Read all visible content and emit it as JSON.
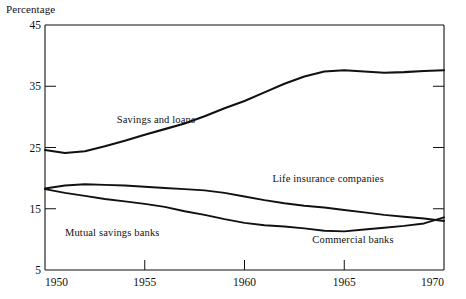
{
  "chart_data": {
    "type": "line",
    "title": "",
    "ylabel": "Percentage",
    "xlabel": "",
    "xlim": [
      1950,
      1970
    ],
    "ylim": [
      5,
      45
    ],
    "grid": false,
    "legend_position": "inline-annotations",
    "yticks": [
      5,
      15,
      25,
      35,
      45
    ],
    "xticks": [
      1950,
      1955,
      1960,
      1965,
      1970
    ],
    "series": [
      {
        "name": "Savings and loans",
        "x": [
          1950,
          1951,
          1952,
          1953,
          1954,
          1955,
          1956,
          1957,
          1958,
          1959,
          1960,
          1961,
          1962,
          1963,
          1964,
          1965,
          1966,
          1967,
          1968,
          1969,
          1970
        ],
        "values": [
          24.6,
          24.1,
          24.4,
          25.2,
          26.1,
          27.1,
          28.0,
          28.9,
          30.1,
          31.4,
          32.6,
          34.0,
          35.4,
          36.6,
          37.4,
          37.6,
          37.4,
          37.2,
          37.3,
          37.5,
          37.6
        ]
      },
      {
        "name": "Life insurance companies",
        "x": [
          1950,
          1951,
          1952,
          1953,
          1954,
          1955,
          1956,
          1957,
          1958,
          1959,
          1960,
          1961,
          1962,
          1963,
          1964,
          1965,
          1966,
          1967,
          1968,
          1969,
          1970
        ],
        "values": [
          18.3,
          18.8,
          19.0,
          18.9,
          18.8,
          18.6,
          18.4,
          18.2,
          18.0,
          17.6,
          17.0,
          16.4,
          15.9,
          15.5,
          15.2,
          14.8,
          14.4,
          14.0,
          13.7,
          13.4,
          13.0
        ]
      },
      {
        "name": "Mutual savings banks",
        "x": [
          1950,
          1951,
          1952,
          1953,
          1954,
          1955,
          1956,
          1957,
          1958,
          1959,
          1960,
          1961,
          1962,
          1963,
          1964,
          1965,
          1966,
          1967,
          1968,
          1969,
          1970
        ],
        "values": [
          18.2,
          17.6,
          17.1,
          16.6,
          16.2,
          15.8,
          15.3,
          14.6,
          14.0,
          13.3,
          12.7,
          12.3,
          12.1,
          11.8,
          11.4,
          11.3,
          11.6,
          11.9,
          12.2,
          12.6,
          13.6
        ]
      }
    ],
    "annotations": [
      {
        "text": "Savings and loans",
        "x": 1953.6,
        "y": 29.0
      },
      {
        "text": "Life insurance companies",
        "x": 1961.4,
        "y": 19.4
      },
      {
        "text": "Mutual savings banks",
        "x": 1951.0,
        "y": 10.6
      },
      {
        "text": "Commercial banks",
        "x": 1963.4,
        "y": 9.4
      }
    ]
  },
  "axis": {
    "ylabel": "Percentage"
  }
}
